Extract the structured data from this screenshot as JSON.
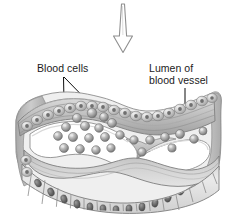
{
  "figure": {
    "type": "anatomical-illustration",
    "background_color": "#ffffff",
    "style": "grayscale pencil / airbrush shaded medical illustration",
    "arrow": {
      "name": "downward-pressure-arrow",
      "direction": "down",
      "fill": "#ffffff",
      "stroke": "#8c8c8c"
    },
    "labels": [
      {
        "id": "blood-cells",
        "text": "Blood cells",
        "lines": [
          "Blood cells"
        ],
        "x": 37,
        "y": 62,
        "leaders": 2
      },
      {
        "id": "lumen",
        "text": "Lumen of blood vessel",
        "lines": [
          "Lumen of",
          "blood vessel"
        ],
        "x": 149,
        "y": 62,
        "leaders": 1
      }
    ],
    "colors": {
      "text": "#1b1b1b",
      "leader_line": "#101010",
      "tissue_light": "#e6e6e6",
      "tissue_mid": "#bdbdbd",
      "tissue_dark": "#8a8a8a",
      "outline": "#6f6f6f",
      "cell_fill": "#b4b4b4",
      "cell_shadow": "#707070",
      "cell_highlight": "#e9e9e9",
      "nucleus": "#5e5e5e",
      "lumen_fill": "#ffffff"
    },
    "structures": [
      {
        "name": "upper-endothelial-cell-row",
        "description": "row of rounded cells along the wavy upper vessel wall"
      },
      {
        "name": "vessel-wall-upper",
        "description": "layered connective tissue band above the lumen"
      },
      {
        "name": "lumen-cavity",
        "description": "open white interior of the blood vessel, pinched in the middle"
      },
      {
        "name": "blood-cell-cluster",
        "description": "scattered grey spherical blood cells inside the lumen"
      },
      {
        "name": "vessel-wall-lower",
        "description": "layered connective tissue band below the lumen"
      },
      {
        "name": "columnar-epithelium-row",
        "description": "bottom row of columnar epithelial cells with dark oval nuclei"
      }
    ],
    "blood_cells": [
      {
        "cx": 77,
        "cy": 118,
        "r": 4.6
      },
      {
        "cx": 92,
        "cy": 113,
        "r": 4.8
      },
      {
        "cx": 104,
        "cy": 117,
        "r": 4.4
      },
      {
        "cx": 66,
        "cy": 127,
        "r": 4.5
      },
      {
        "cx": 85,
        "cy": 126,
        "r": 4.6
      },
      {
        "cx": 99,
        "cy": 128,
        "r": 4.3
      },
      {
        "cx": 112,
        "cy": 123,
        "r": 4.5
      },
      {
        "cx": 58,
        "cy": 136,
        "r": 4.4
      },
      {
        "cx": 73,
        "cy": 137,
        "r": 4.6
      },
      {
        "cx": 89,
        "cy": 138,
        "r": 4.4
      },
      {
        "cx": 105,
        "cy": 137,
        "r": 4.5
      },
      {
        "cx": 120,
        "cy": 135,
        "r": 4.3
      },
      {
        "cx": 64,
        "cy": 148,
        "r": 4.5
      },
      {
        "cx": 80,
        "cy": 149,
        "r": 4.4
      },
      {
        "cx": 96,
        "cy": 150,
        "r": 4.3
      },
      {
        "cx": 111,
        "cy": 148,
        "r": 4.2
      },
      {
        "cx": 134,
        "cy": 140,
        "r": 4.2
      },
      {
        "cx": 150,
        "cy": 140,
        "r": 4.3
      },
      {
        "cx": 165,
        "cy": 137,
        "r": 4.4
      },
      {
        "cx": 180,
        "cy": 134,
        "r": 4.5
      },
      {
        "cx": 194,
        "cy": 139,
        "r": 4.3
      },
      {
        "cx": 203,
        "cy": 131,
        "r": 4.0
      },
      {
        "cx": 142,
        "cy": 152,
        "r": 4.2
      },
      {
        "cx": 172,
        "cy": 148,
        "r": 4.1
      }
    ]
  }
}
